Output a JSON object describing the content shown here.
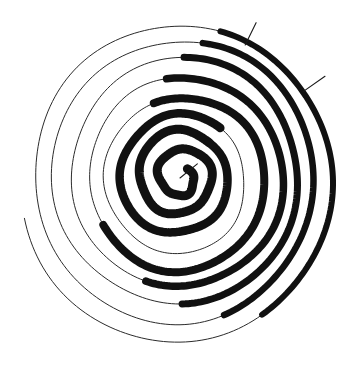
{
  "figure": {
    "background_color": "#ffffff",
    "thin_stroke_color": "#2b2b2b",
    "thick_stroke_color": "#111111",
    "canvas": {
      "width": 354,
      "height": 371
    }
  },
  "chart_data": {
    "type": "line",
    "subtitle": "Stroke weight varies by angle: heavy on the upper arc, light elsewhere",
    "xlabel": "",
    "ylabel": "",
    "grid": false,
    "legend": "none",
    "coordinate_system": "polar",
    "center": {
      "x": 180,
      "y": 178
    },
    "aspect_ratio_x": 1.0,
    "aspect_ratio_y": 1.04,
    "angle_units": "degrees",
    "angle_zero_direction": "up",
    "angle_positive_direction": "clockwise",
    "start_angle_deg": 40,
    "total_turns": 8.6,
    "radius_start": 10,
    "radius_end": 160,
    "turn_radii": [
      14,
      32,
      50,
      68,
      85,
      102,
      118,
      134,
      148,
      160
    ],
    "stroke_width_thin": 1.0,
    "stroke_width_thick_inner": 9.0,
    "stroke_width_thick_outer": 5.5,
    "thick_segments": [
      {
        "turn": 1,
        "radius": 14,
        "start_deg": 0,
        "end_deg": 360,
        "width": 9.0
      },
      {
        "turn": 2,
        "radius": 32,
        "start_deg": 0,
        "end_deg": 360,
        "width": 9.0
      },
      {
        "turn": 3,
        "radius": 50,
        "start_deg": 0,
        "end_deg": 360,
        "width": 8.5
      },
      {
        "turn": 4,
        "radius": 68,
        "start_deg": 300,
        "end_deg": 560,
        "width": 8.0
      },
      {
        "turn": 5,
        "radius": 85,
        "start_deg": 312,
        "end_deg": 520,
        "width": 7.5
      },
      {
        "turn": 6,
        "radius": 102,
        "start_deg": 322,
        "end_deg": 500,
        "width": 7.0
      },
      {
        "turn": 7,
        "radius": 118,
        "start_deg": 330,
        "end_deg": 482,
        "width": 6.5
      },
      {
        "turn": 8,
        "radius": 134,
        "start_deg": 336,
        "end_deg": 468,
        "width": 6.0
      },
      {
        "turn": 9,
        "radius": 148,
        "start_deg": 342,
        "end_deg": 452,
        "width": 5.5
      }
    ],
    "annotations": [
      {
        "name": "center-pointer",
        "type": "radial-line",
        "from_radius": 0,
        "to_radius": 22,
        "angle_deg": 52
      },
      {
        "name": "tick-upper",
        "type": "radial-tick",
        "at_radius": 152,
        "angle_deg": 27,
        "length": 24
      },
      {
        "name": "tick-right",
        "type": "radial-tick",
        "at_radius": 158,
        "angle_deg": 56,
        "length": 26
      }
    ]
  }
}
